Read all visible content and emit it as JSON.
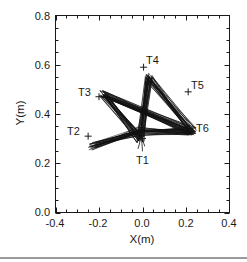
{
  "chart_data": {
    "type": "line",
    "title": "",
    "xlabel": "X(m)",
    "ylabel": "Y(m)",
    "xlim": [
      -0.4,
      0.4
    ],
    "ylim": [
      0.0,
      0.8
    ],
    "grid": false,
    "legend": null,
    "x_ticks": [
      -0.4,
      -0.2,
      0.0,
      0.2,
      0.4
    ],
    "x_tick_labels": [
      "-0.4",
      "-0.2",
      "0.0",
      "0.2",
      "0.4"
    ],
    "y_ticks": [
      0.0,
      0.2,
      0.4,
      0.6,
      0.8
    ],
    "y_tick_labels": [
      "0.0",
      "0.2",
      "0.4",
      "0.6",
      "0.8"
    ],
    "minor_tick_step": 0.05,
    "targets": [
      {
        "name": "T1",
        "x": 0.0,
        "y": 0.3
      },
      {
        "name": "T2",
        "x": -0.25,
        "y": 0.31
      },
      {
        "name": "T3",
        "x": -0.2,
        "y": 0.47
      },
      {
        "name": "T4",
        "x": 0.005,
        "y": 0.59
      },
      {
        "name": "T5",
        "x": 0.21,
        "y": 0.49
      },
      {
        "name": "T6",
        "x": 0.23,
        "y": 0.33
      }
    ],
    "trajectory_vertices": {
      "description": "Repeated hand-path trials forming a bundle; approximate mean vertices",
      "path": [
        {
          "x": -0.23,
          "y": 0.27
        },
        {
          "x": -0.01,
          "y": 0.33
        },
        {
          "x": 0.23,
          "y": 0.33
        },
        {
          "x": -0.18,
          "y": 0.48
        },
        {
          "x": -0.01,
          "y": 0.3
        },
        {
          "x": 0.03,
          "y": 0.55
        },
        {
          "x": 0.23,
          "y": 0.33
        }
      ]
    },
    "series_color": "#111111"
  },
  "labels": {
    "x_axis_title": "X(m)",
    "y_axis_title": "Y(m)",
    "T1": "T1",
    "T2": "T2",
    "T3": "T3",
    "T4": "T4",
    "T5": "T5",
    "T6": "T6",
    "xt0": "-0.4",
    "xt1": "-0.2",
    "xt2": "0.0",
    "xt3": "0.2",
    "xt4": "0.4",
    "yt0": "0.0",
    "yt1": "0.2",
    "yt2": "0.4",
    "yt3": "0.6",
    "yt4": "0.8"
  },
  "colors": {
    "ink": "#111111",
    "frame": "#1a1a1a",
    "rule": "#9a9a9a",
    "background": "#ffffff"
  }
}
